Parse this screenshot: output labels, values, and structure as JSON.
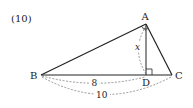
{
  "problem": {
    "number_label": "(10)"
  },
  "figure": {
    "vertices": {
      "A": {
        "label": "A"
      },
      "B": {
        "label": "B"
      },
      "C": {
        "label": "C"
      },
      "D": {
        "label": "D"
      }
    },
    "measurements": {
      "BD": "8",
      "BC": "10",
      "AD": "x"
    },
    "marks": [
      "right-angle-at-D",
      "equal-angle-arcs-at-A"
    ],
    "colors": {
      "line": "#222222",
      "dashed": "#555555",
      "background": "#ffffff"
    }
  }
}
